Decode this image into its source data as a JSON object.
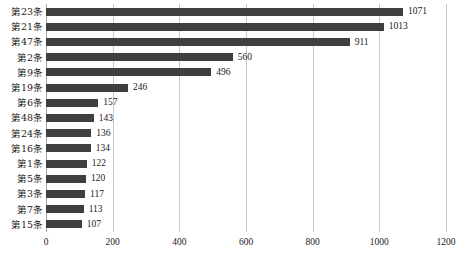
{
  "chart_data": {
    "type": "bar",
    "orientation": "horizontal",
    "title": "",
    "subtitle": "",
    "xlabel": "",
    "ylabel": "",
    "xlim": [
      0,
      1200
    ],
    "xticks": [
      0,
      200,
      400,
      600,
      800,
      1000,
      1200
    ],
    "xtick_labels": [
      "0",
      "200",
      "400",
      "600",
      "800",
      "1000",
      "1200"
    ],
    "grid": true,
    "grid_axis": "x",
    "legend": false,
    "legend_position": "none",
    "bar_color": "#3f3f3f",
    "gridline_color": "#c9c9c9",
    "axis_color": "#a6a6a6",
    "text_color": "#1a1a1a",
    "show_data_labels": true,
    "categories": [
      "第23条",
      "第21条",
      "第47条",
      "第2条",
      "第9条",
      "第19条",
      "第6条",
      "第48条",
      "第24条",
      "第16条",
      "第1条",
      "第5条",
      "第3条",
      "第7条",
      "第15条"
    ],
    "values": [
      1071,
      1013,
      911,
      560,
      496,
      246,
      157,
      143,
      136,
      134,
      122,
      120,
      117,
      113,
      107
    ],
    "value_labels": [
      "1071",
      "1013",
      "911",
      "560",
      "496",
      "246",
      "157",
      "143",
      "136",
      "134",
      "122",
      "120",
      "117",
      "113",
      "107"
    ]
  }
}
